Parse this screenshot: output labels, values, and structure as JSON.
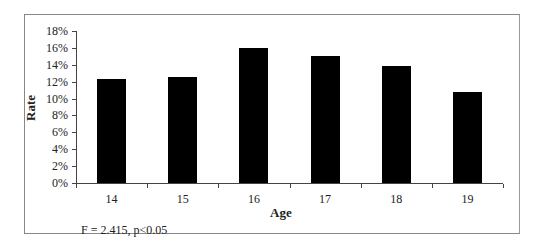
{
  "chart_data": {
    "type": "bar",
    "title": "",
    "xlabel": "Age",
    "ylabel": "Rate",
    "categories": [
      "14",
      "15",
      "16",
      "17",
      "18",
      "19"
    ],
    "values": [
      12.3,
      12.5,
      16.0,
      15.0,
      13.9,
      10.8
    ],
    "value_unit": "%",
    "ylim": [
      0,
      18
    ],
    "yticks": [
      "0%",
      "2%",
      "4%",
      "6%",
      "8%",
      "10%",
      "12%",
      "14%",
      "16%",
      "18%"
    ],
    "grid": false,
    "legend": null,
    "bar_color": "#000000",
    "annotation": "F = 2.415, p<0.05"
  }
}
